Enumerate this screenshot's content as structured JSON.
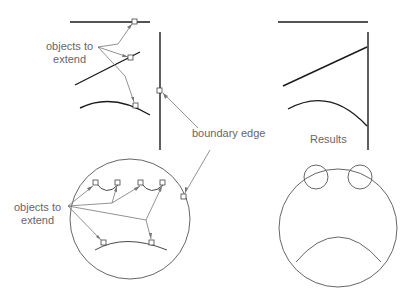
{
  "labels": {
    "objects_to_extend_top": [
      "objects to",
      "extend"
    ],
    "boundary_edge": "boundary edge",
    "objects_to_extend_bottom": [
      "objects to",
      "extend"
    ],
    "results": "Results"
  },
  "colors": {
    "geometry": "#1a1a1a",
    "leader": "#777777",
    "label": "#666666",
    "circle": "#555555"
  }
}
